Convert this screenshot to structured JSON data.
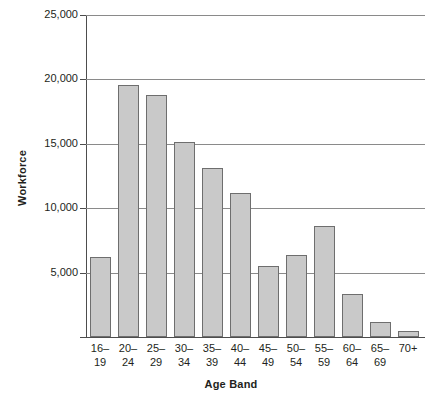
{
  "chart_data": {
    "type": "bar",
    "title": "",
    "xlabel": "Age Band",
    "ylabel": "Workforce",
    "categories": [
      "16–19",
      "20–24",
      "25–29",
      "30–34",
      "35–39",
      "40–44",
      "45–49",
      "50–54",
      "55–59",
      "60–64",
      "65–69",
      "70+"
    ],
    "category_lines": [
      [
        "16–",
        "19"
      ],
      [
        "20–",
        "24"
      ],
      [
        "25–",
        "29"
      ],
      [
        "30–",
        "34"
      ],
      [
        "35–",
        "39"
      ],
      [
        "40–",
        "44"
      ],
      [
        "45–",
        "49"
      ],
      [
        "50–",
        "54"
      ],
      [
        "55–",
        "59"
      ],
      [
        "60–",
        "64"
      ],
      [
        "65–",
        "69"
      ],
      [
        "70+",
        ""
      ]
    ],
    "values": [
      6200,
      19550,
      18750,
      15150,
      13100,
      11200,
      5500,
      6400,
      8650,
      3350,
      1200,
      500
    ],
    "ylim": [
      0,
      25000
    ],
    "ytick_values": [
      25000,
      20000,
      15000,
      10000,
      5000
    ],
    "ytick_labels": [
      "25,000",
      "20,000",
      "15,000",
      "10,000",
      "5,000"
    ],
    "grid": true,
    "legend": "none",
    "bar_fill_color": "#c9c9c9",
    "bar_border_color": "#6e6e6e",
    "gridline_color": "#8a8a8a",
    "axis_color": "#4d4d4d"
  }
}
